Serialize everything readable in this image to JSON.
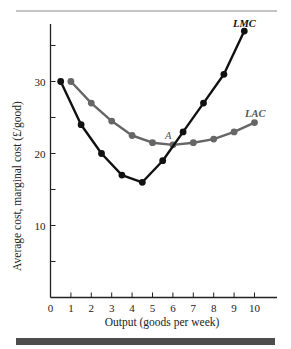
{
  "chart_data": {
    "type": "line",
    "title": "",
    "xlabel": "Output (goods per week)",
    "ylabel": "Average cost, marginal cost (£/good)",
    "xlim": [
      0,
      11
    ],
    "ylim": [
      0,
      38
    ],
    "x_ticks": [
      0,
      1,
      2,
      3,
      4,
      5,
      6,
      7,
      8,
      9,
      10
    ],
    "y_ticks": [
      10,
      20,
      30
    ],
    "y_minor_ticks": [
      5,
      15,
      25,
      35
    ],
    "grid": false,
    "legend": "inline labels",
    "series": [
      {
        "name": "LMC",
        "color": "#111111",
        "x": [
          0.5,
          1.5,
          2.5,
          3.5,
          4.5,
          5.5,
          6.5,
          7.5,
          8.5,
          9.5
        ],
        "values": [
          30,
          24,
          20,
          17,
          16,
          19,
          23,
          27,
          31,
          37
        ]
      },
      {
        "name": "LAC",
        "color": "#666666",
        "x": [
          1,
          2,
          3,
          4,
          5,
          6,
          7,
          8,
          9,
          10
        ],
        "values": [
          30,
          27,
          24.5,
          22.5,
          21.5,
          21.2,
          21.5,
          22,
          23,
          24.3
        ]
      }
    ],
    "annotations": [
      {
        "text": "A",
        "x": 5.9,
        "y": 22.5,
        "note": "intersection of LMC and LAC at minimum LAC"
      }
    ]
  },
  "labels": {
    "lmc": "LMC",
    "lac": "LAC",
    "point_a": "A",
    "xlabel": "Output (goods per week)",
    "ylabel": "Average cost, marginal cost (£/good)"
  },
  "style": {
    "rule_color": "#8a8a8a",
    "bottom_bar_color": "#4d4d4d",
    "axis_color": "#222222"
  }
}
